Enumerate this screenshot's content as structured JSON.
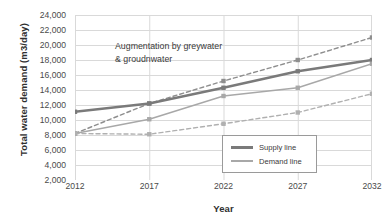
{
  "chart_data": {
    "type": "line",
    "title": "",
    "xlabel": "Year",
    "ylabel": "Total water demand (m3/day)",
    "categories": [
      2012,
      2017,
      2022,
      2027,
      2032
    ],
    "x_tick_labels": [
      "2012",
      "2017",
      "2022",
      "2027",
      "2032"
    ],
    "y_tick_labels": [
      "24,000",
      "22,000",
      "20,000",
      "18,000",
      "16,000",
      "14,000",
      "12,000",
      "10,000",
      "8,000",
      "6,000",
      "4,000",
      "2,000"
    ],
    "y_tick_values": [
      24000,
      22000,
      20000,
      18000,
      16000,
      14000,
      12000,
      10000,
      8000,
      6000,
      4000,
      2000
    ],
    "ylim": [
      2000,
      24000
    ],
    "xlim": [
      2012,
      2032
    ],
    "grid": true,
    "legend_position": "inside-bottom-right",
    "series": [
      {
        "name": "Upper dashed projection",
        "style": "dashed",
        "color": "#8e8e8e",
        "values": [
          8200,
          12200,
          15200,
          18000,
          21000
        ]
      },
      {
        "name": "Supply line",
        "style": "solid-thick",
        "color": "#7a7a7a",
        "values": [
          11100,
          12200,
          14300,
          16500,
          18000
        ]
      },
      {
        "name": "Demand line",
        "style": "solid-thin",
        "color": "#a8a8a8",
        "values": [
          8200,
          10100,
          13200,
          14300,
          17500
        ]
      },
      {
        "name": "Lower dashed projection",
        "style": "dashed",
        "color": "#b0b0b0",
        "values": [
          8200,
          8100,
          9500,
          11000,
          13500
        ]
      }
    ],
    "annotations": [
      {
        "line1": "Augmentation by greywater",
        "line2": "& groudnwater"
      }
    ]
  },
  "legend": {
    "items": [
      {
        "label": "Supply line"
      },
      {
        "label": "Demand line"
      }
    ]
  },
  "colors": {
    "grid": "#d9d9d9",
    "axis": "#bdbdbd",
    "text": "#3b3b3b",
    "supply": "#7a7a7a",
    "demand": "#a8a8a8",
    "dashed": "#9a9a9a",
    "background": "#ffffff"
  }
}
